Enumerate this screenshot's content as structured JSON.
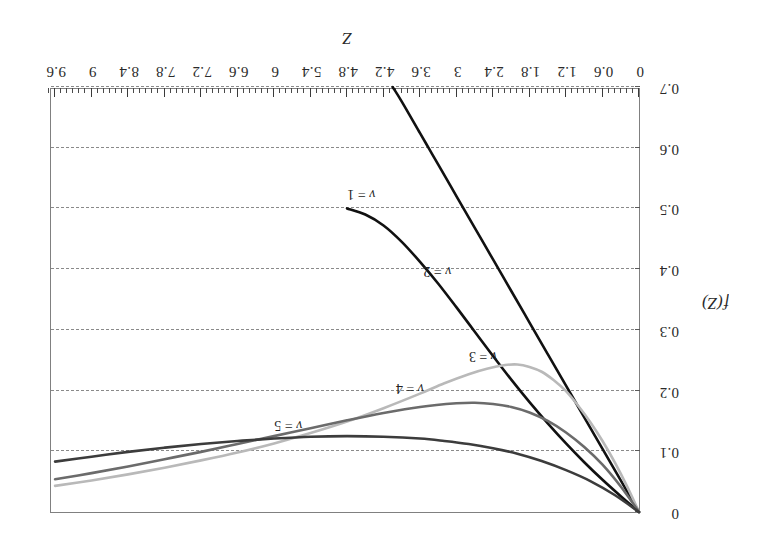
{
  "chart_data": {
    "type": "line",
    "title": "",
    "xlabel": "Z",
    "ylabel": "f(Z)",
    "xlim": [
      0,
      9.7
    ],
    "ylim": [
      0,
      0.7
    ],
    "y_axis_inverted": true,
    "grid": "horizontal dashed gridlines at every 0.1 of f(Z)",
    "legend": "inline curve annotations",
    "rotation_note": "figure rendered rotated 180 degrees",
    "xticks": [
      "0",
      "0.6",
      "1.2",
      "1.8",
      "2.4",
      "3",
      "3.6",
      "4.2",
      "4.8",
      "5.4",
      "6",
      "6.6",
      "7.2",
      "7.8",
      "8.4",
      "9",
      "9.6"
    ],
    "xtick_values": [
      0,
      0.6,
      1.2,
      1.8,
      2.4,
      3,
      3.6,
      4.2,
      4.8,
      5.4,
      6,
      6.6,
      7.2,
      7.8,
      8.4,
      9,
      9.6
    ],
    "xtick_minor_step": 0.1,
    "yticks": [
      "0",
      "0.1",
      "0.2",
      "0.3",
      "0.4",
      "0.5",
      "0.6",
      "0.7"
    ],
    "ytick_values": [
      0,
      0.1,
      0.2,
      0.3,
      0.4,
      0.5,
      0.6,
      0.7
    ],
    "series": [
      {
        "name": "v = 1",
        "label": "v = 1",
        "color": "#111111",
        "width": 2.6,
        "label_x": 4.35,
        "label_y": 0.512,
        "points": [
          [
            0.0,
            0.0
          ],
          [
            0.3,
            0.052
          ],
          [
            0.6,
            0.104
          ],
          [
            0.9,
            0.156
          ],
          [
            1.2,
            0.208
          ],
          [
            1.5,
            0.26
          ],
          [
            1.8,
            0.312
          ],
          [
            2.1,
            0.364
          ],
          [
            2.4,
            0.416
          ],
          [
            2.7,
            0.468
          ],
          [
            3.0,
            0.52
          ],
          [
            3.3,
            0.572
          ],
          [
            3.45,
            0.598
          ],
          [
            3.6,
            0.624
          ],
          [
            3.9,
            0.676
          ],
          [
            4.05,
            0.7
          ]
        ]
      },
      {
        "name": "v = 2",
        "label": "v = 2",
        "color": "#111111",
        "width": 2.6,
        "label_x": 3.1,
        "label_y": 0.385,
        "points": [
          [
            0.0,
            0.0
          ],
          [
            0.3,
            0.026
          ],
          [
            0.6,
            0.053
          ],
          [
            0.9,
            0.082
          ],
          [
            1.2,
            0.113
          ],
          [
            1.5,
            0.146
          ],
          [
            1.8,
            0.181
          ],
          [
            2.1,
            0.218
          ],
          [
            2.4,
            0.257
          ],
          [
            2.7,
            0.297
          ],
          [
            3.0,
            0.337
          ],
          [
            3.3,
            0.376
          ],
          [
            3.6,
            0.412
          ],
          [
            3.9,
            0.445
          ],
          [
            4.2,
            0.472
          ],
          [
            4.5,
            0.49
          ],
          [
            4.8,
            0.5
          ]
        ]
      },
      {
        "name": "v = 3",
        "label": "v = 3",
        "color": "#b9b9b9",
        "width": 2.6,
        "label_x": 2.35,
        "label_y": 0.246,
        "points": [
          [
            0.0,
            0.0
          ],
          [
            0.2,
            0.043
          ],
          [
            0.4,
            0.082
          ],
          [
            0.6,
            0.117
          ],
          [
            0.8,
            0.148
          ],
          [
            1.0,
            0.175
          ],
          [
            1.2,
            0.199
          ],
          [
            1.4,
            0.217
          ],
          [
            1.6,
            0.231
          ],
          [
            1.8,
            0.239
          ],
          [
            2.0,
            0.243
          ],
          [
            2.2,
            0.242
          ],
          [
            2.5,
            0.236
          ],
          [
            2.8,
            0.227
          ],
          [
            3.2,
            0.212
          ],
          [
            3.6,
            0.195
          ],
          [
            4.2,
            0.171
          ],
          [
            4.8,
            0.149
          ],
          [
            5.4,
            0.13
          ],
          [
            6.0,
            0.113
          ],
          [
            6.6,
            0.098
          ],
          [
            7.2,
            0.085
          ],
          [
            7.8,
            0.073
          ],
          [
            8.4,
            0.062
          ],
          [
            9.0,
            0.052
          ],
          [
            9.6,
            0.043
          ]
        ]
      },
      {
        "name": "v = 4",
        "label": "v = 4",
        "color": "#6b6b6b",
        "width": 2.6,
        "label_x": 3.55,
        "label_y": 0.193,
        "points": [
          [
            0.0,
            0.0
          ],
          [
            0.3,
            0.042
          ],
          [
            0.6,
            0.078
          ],
          [
            0.9,
            0.107
          ],
          [
            1.2,
            0.131
          ],
          [
            1.5,
            0.15
          ],
          [
            1.8,
            0.164
          ],
          [
            2.1,
            0.173
          ],
          [
            2.4,
            0.178
          ],
          [
            2.7,
            0.18
          ],
          [
            3.0,
            0.179
          ],
          [
            3.6,
            0.173
          ],
          [
            4.2,
            0.163
          ],
          [
            4.8,
            0.151
          ],
          [
            5.4,
            0.138
          ],
          [
            6.0,
            0.125
          ],
          [
            6.6,
            0.112
          ],
          [
            7.2,
            0.099
          ],
          [
            7.8,
            0.087
          ],
          [
            8.4,
            0.075
          ],
          [
            9.0,
            0.064
          ],
          [
            9.6,
            0.054
          ]
        ]
      },
      {
        "name": "v = 5",
        "label": "v = 5",
        "color": "#3c3c3c",
        "width": 2.6,
        "label_x": 5.55,
        "label_y": 0.132,
        "points": [
          [
            0.0,
            0.0
          ],
          [
            0.4,
            0.028
          ],
          [
            0.8,
            0.051
          ],
          [
            1.2,
            0.069
          ],
          [
            1.6,
            0.084
          ],
          [
            2.0,
            0.096
          ],
          [
            2.4,
            0.105
          ],
          [
            2.8,
            0.112
          ],
          [
            3.2,
            0.117
          ],
          [
            3.6,
            0.121
          ],
          [
            4.2,
            0.124
          ],
          [
            4.8,
            0.125
          ],
          [
            5.4,
            0.124
          ],
          [
            6.0,
            0.121
          ],
          [
            6.6,
            0.117
          ],
          [
            7.2,
            0.112
          ],
          [
            7.8,
            0.106
          ],
          [
            8.4,
            0.099
          ],
          [
            9.0,
            0.091
          ],
          [
            9.6,
            0.083
          ]
        ]
      }
    ]
  }
}
